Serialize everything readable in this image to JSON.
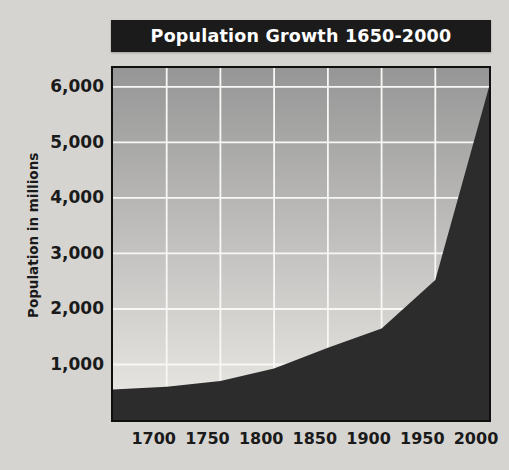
{
  "title_bar": {
    "title": "Population Growth 1650-2000"
  },
  "colors": {
    "page_bg": "#d6d4d1",
    "title_bar_bg": "#1b1b1b",
    "title_text": "#ffffff",
    "plot_gradient_top": "#969696",
    "plot_gradient_bottom": "#edebe7",
    "grid_line": "#f7f7f5",
    "area_fill": "#2c2c2c",
    "plot_border": "#0f0f0f",
    "label_text": "#1a1a1a"
  },
  "chart_data": {
    "type": "area",
    "title": "Population Growth 1650-2000",
    "xlabel": "",
    "ylabel": "Population in millions",
    "x": [
      1650,
      1700,
      1750,
      1800,
      1850,
      1900,
      1950,
      2000
    ],
    "values": [
      550,
      600,
      700,
      930,
      1300,
      1650,
      2520,
      6000
    ],
    "x_ticks": [
      1700,
      1750,
      1800,
      1850,
      1900,
      1950,
      2000
    ],
    "x_tick_labels": [
      "1700",
      "1750",
      "1800",
      "1850",
      "1900",
      "1950",
      "2000"
    ],
    "y_ticks": [
      1000,
      2000,
      3000,
      4000,
      5000,
      6000
    ],
    "y_tick_labels": [
      "1,000",
      "2,000",
      "3,000",
      "4,000",
      "5,000",
      "6,000"
    ],
    "xlim": [
      1650,
      2000
    ],
    "ylim": [
      0,
      6340
    ],
    "grid": true,
    "legend": false
  }
}
